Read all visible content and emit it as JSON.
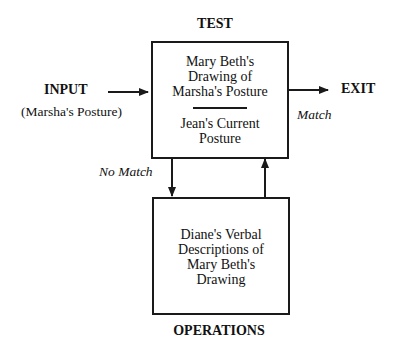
{
  "diagram": {
    "type": "TOTE flowchart",
    "test": {
      "heading": "TEST",
      "upper_text": [
        "Mary Beth's",
        "Drawing of",
        "Marsha's Posture"
      ],
      "lower_text": [
        "Jean's Current",
        "Posture"
      ]
    },
    "input": {
      "label": "INPUT",
      "sublabel": "(Marsha's Posture)"
    },
    "exit": {
      "label": "EXIT",
      "condition": "Match"
    },
    "loop": {
      "condition": "No Match"
    },
    "operations": {
      "heading": "OPERATIONS",
      "text": [
        "Diane's Verbal",
        "Descriptions of",
        "Mary Beth's",
        "Drawing"
      ]
    },
    "colors": {
      "line": "#1a1a1a",
      "background": "#ffffff",
      "text": "#111111"
    }
  }
}
